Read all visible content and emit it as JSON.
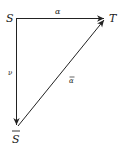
{
  "diagram": {
    "nodes": {
      "S": {
        "label": "S"
      },
      "T": {
        "label": "T"
      },
      "S_bar": {
        "label": "S"
      }
    },
    "edges": {
      "S_to_T": {
        "label": "α"
      },
      "S_to_Sbar": {
        "label": "ν"
      },
      "Sbar_to_T": {
        "label": "α"
      }
    },
    "colors": {
      "stroke": "#222222",
      "background": "#ffffff"
    }
  }
}
